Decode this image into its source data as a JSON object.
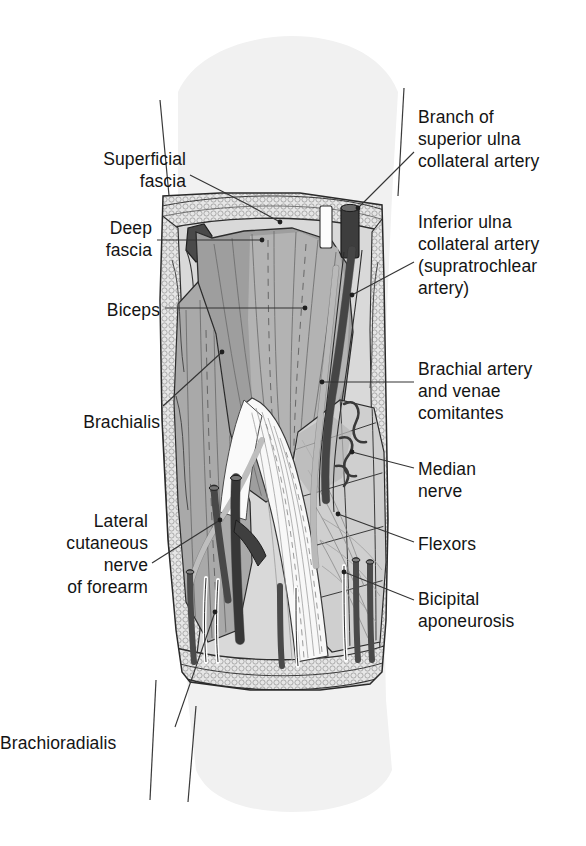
{
  "figure": {
    "view": "anterior dissection of right elbow",
    "colors": {
      "background": "#ffffff",
      "skin_silhouette": "#f0f0f0",
      "superficial_fat": "#e3e3e3",
      "deep_fascia_flap": "#4a4a4a",
      "biceps_muscle": "#9a9a9a",
      "biceps_light": "#b4b4b4",
      "brachialis_muscle": "#a8a8a8",
      "flexor_mass": "#cfcfcf",
      "aponeurosis_white": "#f7f7f7",
      "artery_dark": "#5a5a5a",
      "vessel_cut_dark": "#3c3c3c",
      "nerve_white": "#fdfdfd",
      "outline": "#2a2a2a",
      "label_text": "#141414",
      "leader_line": "#333333"
    }
  },
  "labels": {
    "left": [
      {
        "name": "superficial-fascia",
        "lines": [
          "Superficial",
          "fascia"
        ],
        "text_x": 186,
        "text_y": 148,
        "leader": [
          [
            190,
            175
          ],
          [
            245,
            203
          ],
          [
            280,
            222
          ]
        ],
        "dot": [
          280,
          222
        ]
      },
      {
        "name": "deep-fascia",
        "lines": [
          "Deep",
          "fascia"
        ],
        "text_x": 152,
        "text_y": 217,
        "leader": [
          [
            157,
            240
          ],
          [
            262,
            240
          ]
        ],
        "dot": [
          262,
          240
        ]
      },
      {
        "name": "biceps",
        "lines": [
          "Biceps"
        ],
        "text_x": 160,
        "text_y": 299,
        "leader": [
          [
            165,
            308
          ],
          [
            305,
            308
          ]
        ],
        "dot": [
          305,
          308
        ]
      },
      {
        "name": "brachialis",
        "lines": [
          "Brachialis"
        ],
        "text_x": 160,
        "text_y": 411,
        "leader": [
          [
            163,
            406
          ],
          [
            222,
            352
          ]
        ],
        "dot": [
          222,
          352
        ]
      },
      {
        "name": "lateral-cutaneous-nerve-of-forearm",
        "lines": [
          "Lateral",
          "cutaneous",
          "nerve",
          "of forearm"
        ],
        "text_x": 148,
        "text_y": 510,
        "leader": [
          [
            152,
            563
          ],
          [
            220,
            520
          ]
        ],
        "dot": [
          220,
          520
        ]
      },
      {
        "name": "brachioradialis",
        "lines": [
          "Brachioradialis"
        ],
        "text_x": 58,
        "text_y": 732,
        "leader": [
          [
            175,
            727
          ],
          [
            215,
            612
          ]
        ],
        "dot": [
          215,
          612
        ]
      }
    ],
    "right": [
      {
        "name": "branch-of-superior-ulna-collateral-artery",
        "lines": [
          "Branch of",
          "superior ulna",
          "collateral artery"
        ],
        "text_x": 418,
        "text_y": 106,
        "leader": [
          [
            414,
            152
          ],
          [
            358,
            208
          ]
        ],
        "dot": [
          358,
          208
        ]
      },
      {
        "name": "inferior-ulna-collateral-artery",
        "lines": [
          "Inferior ulna",
          "collateral artery",
          "(supratrochlear",
          "artery)"
        ],
        "text_x": 418,
        "text_y": 211,
        "leader": [
          [
            414,
            262
          ],
          [
            352,
            295
          ]
        ],
        "dot": [
          352,
          295
        ]
      },
      {
        "name": "brachial-artery-and-venae-comitantes",
        "lines": [
          "Brachial artery",
          "and venae",
          "comitantes"
        ],
        "text_x": 418,
        "text_y": 358,
        "leader": [
          [
            414,
            382
          ],
          [
            322,
            382
          ]
        ],
        "dot": [
          322,
          382
        ]
      },
      {
        "name": "median-nerve",
        "lines": [
          "Median",
          "nerve"
        ],
        "text_x": 418,
        "text_y": 458,
        "leader": [
          [
            414,
            468
          ],
          [
            352,
            452
          ]
        ],
        "dot": [
          352,
          452
        ]
      },
      {
        "name": "flexors",
        "lines": [
          "Flexors"
        ],
        "text_x": 418,
        "text_y": 533,
        "leader": [
          [
            414,
            542
          ],
          [
            338,
            514
          ]
        ],
        "dot": [
          338,
          514
        ]
      },
      {
        "name": "bicipital-aponeurosis",
        "lines": [
          "Bicipital",
          "aponeurosis"
        ],
        "text_x": 418,
        "text_y": 588,
        "leader": [
          [
            414,
            600
          ],
          [
            344,
            572
          ]
        ],
        "dot": [
          344,
          572
        ]
      }
    ]
  }
}
